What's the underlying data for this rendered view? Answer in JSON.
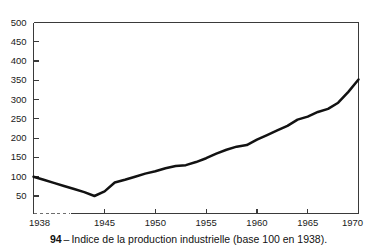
{
  "caption": {
    "number": "94",
    "dash": "–",
    "text": "Indice de la production industrielle (base 100 en 1938)."
  },
  "chart_data": {
    "type": "line",
    "title": "Indice de la production industrielle (base 100 en 1938).",
    "xlabel": "",
    "ylabel": "",
    "xlim": [
      1938,
      1970
    ],
    "ylim": [
      0,
      500
    ],
    "grid": false,
    "legend": null,
    "y_ticks": [
      50,
      100,
      150,
      200,
      250,
      300,
      350,
      400,
      450,
      500
    ],
    "y_tick_labels": [
      "50",
      "100",
      "150",
      "200",
      "250",
      "300",
      "350",
      "400",
      "450",
      "500"
    ],
    "x_ticks": [
      1938,
      1945,
      1950,
      1955,
      1960,
      1965,
      1970
    ],
    "x_tick_labels": [
      "1938",
      "1945",
      "1950",
      "1955",
      "1960",
      "1965",
      "1970"
    ],
    "series": [
      {
        "name": "Indice de la production industrielle",
        "color": "#121212",
        "x": [
          1938,
          1939,
          1940,
          1941,
          1942,
          1943,
          1944,
          1945,
          1946,
          1947,
          1948,
          1949,
          1950,
          1951,
          1952,
          1953,
          1954,
          1955,
          1956,
          1957,
          1958,
          1959,
          1960,
          1961,
          1962,
          1963,
          1964,
          1965,
          1966,
          1967,
          1968,
          1969,
          1970
        ],
        "values": [
          100,
          92,
          84,
          76,
          68,
          60,
          50,
          62,
          85,
          92,
          100,
          108,
          114,
          122,
          128,
          130,
          138,
          148,
          160,
          170,
          178,
          182,
          196,
          208,
          220,
          232,
          248,
          256,
          268,
          276,
          292,
          320,
          352
        ]
      }
    ],
    "annotations": {
      "start_value": 100,
      "start_year": 1938,
      "minimum_value": 50,
      "minimum_year": 1944,
      "end_value": 425,
      "end_year": 1970,
      "baseline_dashed_from": 1938,
      "baseline_dashed_to": 1945
    }
  }
}
